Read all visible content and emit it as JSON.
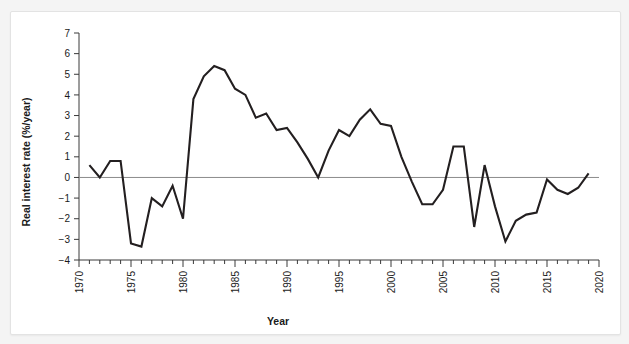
{
  "page": {
    "background_color": "#f4f4f4",
    "card_color": "#ffffff",
    "border_color": "#e3e3e3"
  },
  "chart_data": {
    "type": "line",
    "title": "",
    "subtitle": "",
    "xlabel": "Year",
    "ylabel": "Real interest rate (%/year)",
    "xlim": [
      1970,
      2020
    ],
    "ylim": [
      -4,
      7
    ],
    "grid": false,
    "legend_position": "none",
    "zero_reference_line": true,
    "line_color": "#231f20",
    "zero_line_color": "#8b8b8b",
    "axis_color": "#3a3a3a",
    "ytick_labels": [
      "7",
      "6",
      "5",
      "4",
      "3",
      "2",
      "1",
      "0",
      "-1",
      "-2",
      "-3",
      "-4"
    ],
    "ytick_values": [
      7,
      6,
      5,
      4,
      3,
      2,
      1,
      0,
      -1,
      -2,
      -3,
      -4
    ],
    "xtick_labels": [
      "1970",
      "1975",
      "1980",
      "1985",
      "1990",
      "1995",
      "2000",
      "2005",
      "2010",
      "2015",
      "2020"
    ],
    "xtick_values": [
      1970,
      1975,
      1980,
      1985,
      1990,
      1995,
      2000,
      2005,
      2010,
      2015,
      2020
    ],
    "xtick_minor_interval": 1,
    "x": [
      1971,
      1972,
      1973,
      1974,
      1975,
      1976,
      1977,
      1978,
      1979,
      1980,
      1981,
      1982,
      1983,
      1984,
      1985,
      1986,
      1987,
      1988,
      1989,
      1990,
      1991,
      1992,
      1993,
      1994,
      1995,
      1996,
      1997,
      1998,
      1999,
      2000,
      2001,
      2002,
      2003,
      2004,
      2005,
      2006,
      2007,
      2008,
      2009,
      2010,
      2011,
      2012,
      2013,
      2014,
      2015,
      2016,
      2017,
      2018,
      2019
    ],
    "y": [
      0.6,
      0.0,
      0.8,
      0.8,
      -3.2,
      -3.35,
      -1.0,
      -1.4,
      -0.4,
      -2.0,
      3.8,
      4.9,
      5.4,
      5.2,
      4.3,
      4.0,
      2.9,
      3.1,
      2.3,
      2.4,
      1.7,
      0.9,
      0.0,
      1.3,
      2.3,
      2.0,
      2.8,
      3.3,
      2.6,
      2.5,
      1.0,
      -0.2,
      -1.3,
      -1.3,
      -0.6,
      1.5,
      1.5,
      -2.4,
      0.6,
      -1.4,
      -3.1,
      -2.1,
      -1.8,
      -1.7,
      -0.1,
      -0.6,
      -0.8,
      -0.5,
      0.2
    ],
    "series": [
      {
        "name": "Real interest rate",
        "values": [
          0.6,
          0.0,
          0.8,
          0.8,
          -3.2,
          -3.35,
          -1.0,
          -1.4,
          -0.4,
          -2.0,
          3.8,
          4.9,
          5.4,
          5.2,
          4.3,
          4.0,
          2.9,
          3.1,
          2.3,
          2.4,
          1.7,
          0.9,
          0.0,
          1.3,
          2.3,
          2.0,
          2.8,
          3.3,
          2.6,
          2.5,
          1.0,
          -0.2,
          -1.3,
          -1.3,
          -0.6,
          1.5,
          1.5,
          -2.4,
          0.6,
          -1.4,
          -3.1,
          -2.1,
          -1.8,
          -1.7,
          -0.1,
          -0.6,
          -0.8,
          -0.5,
          0.2
        ]
      }
    ],
    "annotations": []
  }
}
